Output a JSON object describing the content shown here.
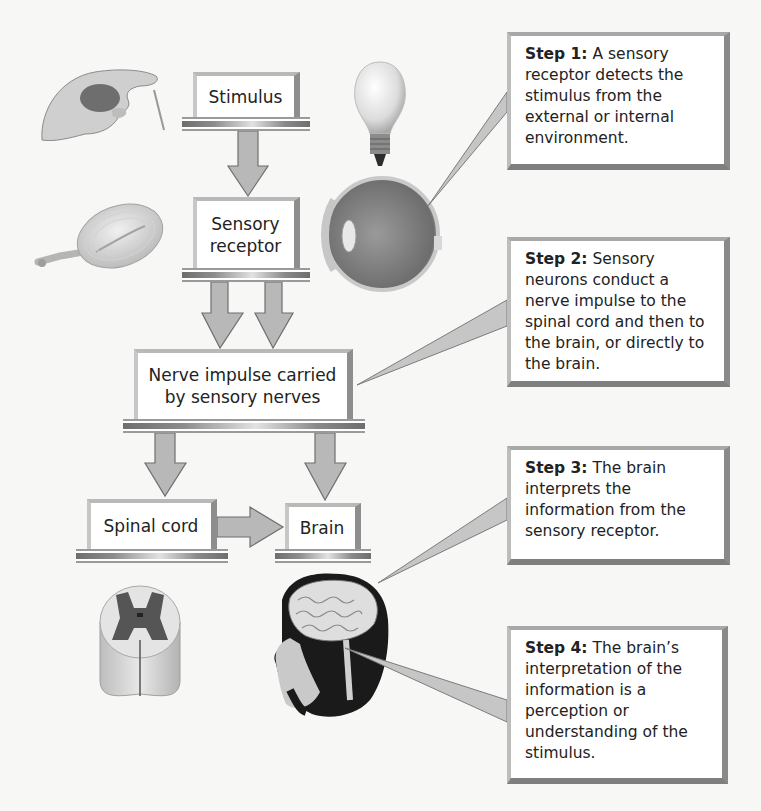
{
  "diagram": {
    "colors": {
      "background": "#f7f7f5",
      "box_fill": "#ffffff",
      "box_border": "#8e8e8e",
      "arrow_fill": "#b8b8b8",
      "arrow_stroke": "#6f6f6f",
      "text": "#222222"
    },
    "flow_nodes": [
      {
        "id": "stimulus",
        "label": "Stimulus"
      },
      {
        "id": "sensory-receptor",
        "label": "Sensory receptor",
        "lines": [
          "Sensory",
          "receptor"
        ]
      },
      {
        "id": "nerve-impulse",
        "label": "Nerve impulse carried by sensory nerves",
        "lines": [
          "Nerve impulse carried",
          "by sensory nerves"
        ]
      },
      {
        "id": "spinal-cord",
        "label": "Spinal cord"
      },
      {
        "id": "brain",
        "label": "Brain"
      }
    ],
    "flow_edges": [
      {
        "from": "stimulus",
        "to": "sensory-receptor"
      },
      {
        "from": "sensory-receptor",
        "to": "nerve-impulse",
        "count": 2
      },
      {
        "from": "nerve-impulse",
        "to": "spinal-cord"
      },
      {
        "from": "nerve-impulse",
        "to": "brain"
      },
      {
        "from": "spinal-cord",
        "to": "brain"
      }
    ],
    "steps": [
      {
        "lead": "Step 1:",
        "text": " A sensory receptor detects the stimulus from the external or internal environment.",
        "points_to": "eye"
      },
      {
        "lead": "Step 2:",
        "text": " Sensory neurons conduct a nerve impulse to the spinal cord and then to the brain, or directly to the brain.",
        "points_to": "nerve-impulse"
      },
      {
        "lead": "Step 3:",
        "text": " The brain interprets the information from the sensory receptor.",
        "points_to": "brain-illustration"
      },
      {
        "lead": "Step 4:",
        "text": " The brain’s interpretation of the information is a perception or understanding of the stimulus.",
        "points_to": "head-illustration"
      }
    ],
    "illustrations": [
      {
        "name": "hand-touch-icon",
        "depicts": "hand touched by a filament"
      },
      {
        "name": "light-bulb-icon",
        "depicts": "light bulb"
      },
      {
        "name": "pacinian-corpuscle-icon",
        "depicts": "sensory receptor corpuscle"
      },
      {
        "name": "eye-cross-section-icon",
        "depicts": "eye cross section"
      },
      {
        "name": "spinal-cord-section-icon",
        "depicts": "spinal cord cross section"
      },
      {
        "name": "head-brain-icon",
        "depicts": "human head with exposed brain"
      }
    ]
  }
}
